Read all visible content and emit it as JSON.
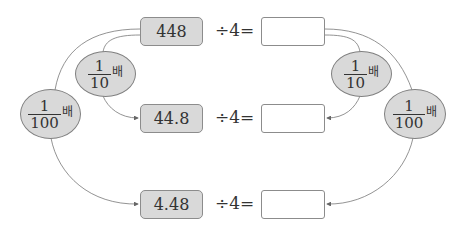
{
  "rows": [
    {
      "value": "448",
      "operator": "÷4=",
      "answer": ""
    },
    {
      "value": "44.8",
      "operator": "÷4=",
      "answer": ""
    },
    {
      "value": "4.48",
      "operator": "÷4=",
      "answer": ""
    }
  ],
  "multipliers": {
    "left_small": {
      "numerator": "1",
      "denominator": "10",
      "suffix": "배"
    },
    "left_large": {
      "numerator": "1",
      "denominator": "100",
      "suffix": "배"
    },
    "right_small": {
      "numerator": "1",
      "denominator": "10",
      "suffix": "배"
    },
    "right_large": {
      "numerator": "1",
      "denominator": "100",
      "suffix": "배"
    }
  },
  "colors": {
    "box_fill": "#d9d9d9",
    "border": "#8c8c8c",
    "line": "#666666"
  }
}
